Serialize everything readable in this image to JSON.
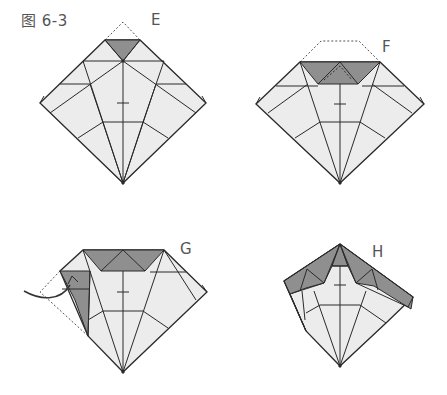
{
  "figure": {
    "title": "图 6-3",
    "colors": {
      "paper_light": "#ececec",
      "paper_dark": "#8f8f8f",
      "line": "#2a2a2a",
      "dashed": "#555555",
      "label": "#555555"
    }
  },
  "steps": [
    {
      "id": "E",
      "label": "E",
      "description": "Top point folded down (valley fold shown dashed)"
    },
    {
      "id": "F",
      "label": "F",
      "description": "Top edge folded down forming dark trapezoid"
    },
    {
      "id": "G",
      "label": "G",
      "description": "Left corner folded inward, curved arrow indicates move"
    },
    {
      "id": "H",
      "label": "H",
      "description": "Both sides folded up, dark flaps visible"
    }
  ]
}
